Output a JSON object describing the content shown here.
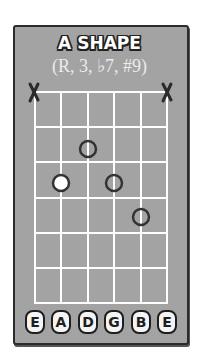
{
  "title": "A SHAPE",
  "subtitle": "(R, 3, ♭7, #9)",
  "colors": {
    "card_bg": "#a3a3a3",
    "grid_line": "#ffffff",
    "dot_outline": "#333333",
    "root_fill": "#ffffff"
  },
  "diagram": {
    "strings": [
      "E",
      "A",
      "D",
      "G",
      "B",
      "E"
    ],
    "frets_shown": 6,
    "muted_strings": [
      "E-low",
      "E-high"
    ],
    "muted_marker": "X",
    "notes": [
      {
        "string": "D",
        "fret": 2,
        "interval": "b7",
        "root": false
      },
      {
        "string": "A",
        "fret": 3,
        "interval": "R",
        "root": true
      },
      {
        "string": "G",
        "fret": 3,
        "interval": "3",
        "root": false
      },
      {
        "string": "B",
        "fret": 4,
        "interval": "#9",
        "root": false
      }
    ]
  },
  "labels": {
    "s0": "E",
    "s1": "A",
    "s2": "D",
    "s3": "G",
    "s4": "B",
    "s5": "E"
  }
}
